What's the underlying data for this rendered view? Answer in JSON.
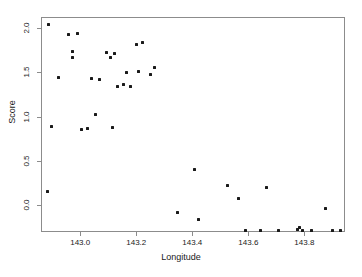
{
  "chart_data": {
    "type": "scatter",
    "title": "",
    "xlabel": "Longitude",
    "ylabel": "Score",
    "xlim": [
      142.86,
      143.945
    ],
    "ylim": [
      -0.3,
      2.12
    ],
    "xticks": [
      143.0,
      143.2,
      143.4,
      143.6,
      143.8
    ],
    "xticklabels": [
      "143.0",
      "143.2",
      "143.4",
      "143.6",
      "143.8"
    ],
    "yticks": [
      0.0,
      0.5,
      1.0,
      1.5,
      2.0
    ],
    "yticklabels": [
      "0.0",
      "0.5",
      "1.0",
      "1.5",
      "2.0"
    ],
    "grid": false,
    "legend": null,
    "marker": "filled-square",
    "marker_color": "#1a1a1a",
    "series": [
      {
        "name": "observations",
        "x": [
          142.882,
          142.953,
          142.986,
          142.968,
          142.968,
          142.918,
          143.036,
          143.064,
          143.089,
          143.104,
          143.118,
          143.15,
          143.161,
          143.175,
          143.196,
          143.204,
          143.218,
          143.246,
          143.261,
          143.0,
          143.021,
          143.05,
          143.111,
          143.129,
          142.893,
          142.879,
          143.343,
          143.418,
          143.404,
          143.521,
          143.561,
          143.586,
          143.639,
          143.661,
          143.704,
          143.771,
          143.779,
          143.789,
          143.821,
          143.871,
          143.896,
          143.925
        ],
        "y": [
          2.05,
          1.93,
          1.95,
          1.74,
          1.67,
          1.45,
          1.44,
          1.43,
          1.73,
          1.67,
          1.72,
          1.37,
          1.51,
          1.35,
          1.82,
          1.52,
          1.84,
          1.48,
          1.56,
          0.86,
          0.88,
          1.03,
          0.89,
          1.35,
          0.9,
          0.17,
          -0.07,
          -0.15,
          0.42,
          0.23,
          0.09,
          -0.27,
          -0.27,
          0.21,
          -0.27,
          -0.26,
          -0.24,
          -0.27,
          -0.27,
          -0.02,
          -0.27,
          -0.27
        ]
      }
    ]
  },
  "axes": {
    "xlabel": "Longitude",
    "ylabel": "Score"
  }
}
